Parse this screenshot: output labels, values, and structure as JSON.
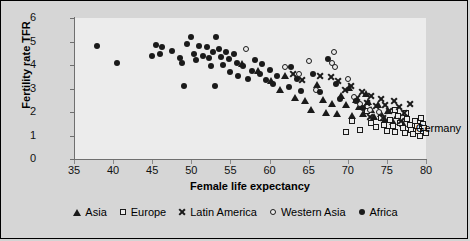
{
  "chart_data": {
    "type": "scatter",
    "title": "",
    "xlabel": "Female life expectancy",
    "ylabel": "Fertility rate TFR",
    "xlim": [
      35,
      80
    ],
    "ylim": [
      0,
      6
    ],
    "xticks": [
      35,
      40,
      45,
      50,
      55,
      60,
      65,
      70,
      75,
      80
    ],
    "yticks": [
      0,
      1,
      2,
      3,
      4,
      5,
      6
    ],
    "grid": false,
    "legend_position": "bottom",
    "annotations": [
      {
        "text": "Germany",
        "x": 78.7,
        "y": 1.32
      }
    ],
    "series": [
      {
        "name": "Asia",
        "marker": "triangle",
        "color": "#1a1a1a",
        "points": [
          [
            56.5,
            4.05
          ],
          [
            58.5,
            3.75
          ],
          [
            60.2,
            3.35
          ],
          [
            61.3,
            2.95
          ],
          [
            62.0,
            3.55
          ],
          [
            63.2,
            2.6
          ],
          [
            64.5,
            2.5
          ],
          [
            65.3,
            2.1
          ],
          [
            66.1,
            3.15
          ],
          [
            66.8,
            2.55
          ],
          [
            67.2,
            2.0
          ],
          [
            68.0,
            2.35
          ],
          [
            68.6,
            1.95
          ],
          [
            69.1,
            2.7
          ],
          [
            69.8,
            2.3
          ],
          [
            70.2,
            3.05
          ],
          [
            70.6,
            1.85
          ],
          [
            71.0,
            2.55
          ],
          [
            71.4,
            2.25
          ],
          [
            71.9,
            1.95
          ],
          [
            72.3,
            2.8
          ],
          [
            72.6,
            2.45
          ],
          [
            73.0,
            2.1
          ],
          [
            73.4,
            1.8
          ],
          [
            73.9,
            2.3
          ],
          [
            74.3,
            1.95
          ],
          [
            74.8,
            1.7
          ],
          [
            75.2,
            2.05
          ],
          [
            75.8,
            1.6
          ],
          [
            76.3,
            1.85
          ],
          [
            77.0,
            1.5
          ]
        ]
      },
      {
        "name": "Europe",
        "marker": "square",
        "color": "#1a1a1a",
        "points": [
          [
            71.5,
            1.25
          ],
          [
            72.4,
            2.05
          ],
          [
            73.0,
            1.55
          ],
          [
            73.6,
            1.35
          ],
          [
            74.2,
            1.75
          ],
          [
            74.6,
            1.45
          ],
          [
            75.0,
            1.2
          ],
          [
            75.4,
            1.65
          ],
          [
            75.8,
            1.4
          ],
          [
            76.1,
            1.15
          ],
          [
            76.4,
            1.85
          ],
          [
            76.7,
            1.55
          ],
          [
            77.0,
            1.3
          ],
          [
            77.3,
            1.1
          ],
          [
            77.6,
            1.7
          ],
          [
            77.9,
            1.45
          ],
          [
            78.1,
            1.25
          ],
          [
            78.3,
            1.05
          ],
          [
            78.6,
            1.6
          ],
          [
            78.8,
            1.4
          ],
          [
            79.0,
            1.2
          ],
          [
            79.2,
            1.0
          ],
          [
            79.4,
            1.75
          ],
          [
            79.6,
            1.5
          ],
          [
            79.8,
            1.3
          ],
          [
            80.0,
            1.1
          ],
          [
            69.8,
            1.15
          ],
          [
            70.6,
            1.6
          ],
          [
            76.0,
            2.1
          ],
          [
            77.4,
            1.95
          ]
        ]
      },
      {
        "name": "Latin America",
        "marker": "cross",
        "color": "#1a1a1a",
        "points": [
          [
            66.5,
            3.55
          ],
          [
            67.8,
            3.5
          ],
          [
            68.7,
            3.3
          ],
          [
            69.6,
            2.95
          ],
          [
            70.4,
            3.1
          ],
          [
            71.2,
            2.6
          ],
          [
            71.8,
            2.85
          ],
          [
            72.4,
            2.4
          ],
          [
            73.0,
            2.7
          ],
          [
            73.6,
            2.25
          ],
          [
            74.2,
            2.55
          ],
          [
            74.8,
            2.3
          ],
          [
            75.3,
            2.05
          ],
          [
            75.9,
            2.45
          ],
          [
            76.5,
            2.2
          ],
          [
            77.2,
            1.95
          ],
          [
            78.0,
            2.35
          ],
          [
            64.2,
            3.35
          ],
          [
            63.0,
            3.6
          ],
          [
            72.9,
            1.8
          ],
          [
            74.5,
            1.75
          ],
          [
            76.8,
            1.6
          ]
        ]
      },
      {
        "name": "Western Asia",
        "marker": "circle-open",
        "color": "#1a1a1a",
        "points": [
          [
            57.0,
            4.7
          ],
          [
            62.0,
            3.9
          ],
          [
            65.0,
            4.15
          ],
          [
            68.2,
            4.55
          ],
          [
            68.0,
            4.1
          ],
          [
            68.4,
            3.9
          ],
          [
            70.0,
            3.4
          ],
          [
            70.8,
            2.65
          ],
          [
            71.6,
            2.35
          ],
          [
            72.8,
            2.1
          ],
          [
            63.8,
            3.6
          ],
          [
            66.0,
            2.95
          ],
          [
            74.0,
            2.0
          ]
        ]
      },
      {
        "name": "Africa",
        "marker": "circle-filled",
        "color": "#1a1a1a",
        "points": [
          [
            38.0,
            4.8
          ],
          [
            40.5,
            4.1
          ],
          [
            45.5,
            4.85
          ],
          [
            46.3,
            4.75
          ],
          [
            46.0,
            4.45
          ],
          [
            47.5,
            4.6
          ],
          [
            48.5,
            4.3
          ],
          [
            48.8,
            4.1
          ],
          [
            49.5,
            4.9
          ],
          [
            50.0,
            5.2
          ],
          [
            50.3,
            4.45
          ],
          [
            50.6,
            4.2
          ],
          [
            51.0,
            4.8
          ],
          [
            51.5,
            4.4
          ],
          [
            52.0,
            4.75
          ],
          [
            52.2,
            4.3
          ],
          [
            52.5,
            3.95
          ],
          [
            52.8,
            4.55
          ],
          [
            53.2,
            5.2
          ],
          [
            53.5,
            4.7
          ],
          [
            53.8,
            4.35
          ],
          [
            54.0,
            4.0
          ],
          [
            54.4,
            4.55
          ],
          [
            54.8,
            4.25
          ],
          [
            55.0,
            3.7
          ],
          [
            55.4,
            4.45
          ],
          [
            55.8,
            4.1
          ],
          [
            56.0,
            3.55
          ],
          [
            56.6,
            3.95
          ],
          [
            57.2,
            3.4
          ],
          [
            57.8,
            3.75
          ],
          [
            58.2,
            4.2
          ],
          [
            58.8,
            3.6
          ],
          [
            59.5,
            3.35
          ],
          [
            60.0,
            3.8
          ],
          [
            60.5,
            3.2
          ],
          [
            61.0,
            3.55
          ],
          [
            62.5,
            3.05
          ],
          [
            63.5,
            3.4
          ],
          [
            64.0,
            2.9
          ],
          [
            65.5,
            3.6
          ],
          [
            66.5,
            2.85
          ],
          [
            67.5,
            4.25
          ],
          [
            68.5,
            3.2
          ],
          [
            71.0,
            2.45
          ],
          [
            72.0,
            2.15
          ],
          [
            49.0,
            3.1
          ],
          [
            45.0,
            4.4
          ],
          [
            53.0,
            3.1
          ],
          [
            59.0,
            4.05
          ],
          [
            62.8,
            3.9
          ],
          [
            69.0,
            2.55
          ]
        ]
      }
    ]
  },
  "legend": {
    "items": [
      {
        "label": "Asia",
        "marker": "triangle"
      },
      {
        "label": "Europe",
        "marker": "square"
      },
      {
        "label": "Latin America",
        "marker": "cross"
      },
      {
        "label": "Western Asia",
        "marker": "circle-open"
      },
      {
        "label": "Africa",
        "marker": "circle-filled"
      }
    ]
  }
}
